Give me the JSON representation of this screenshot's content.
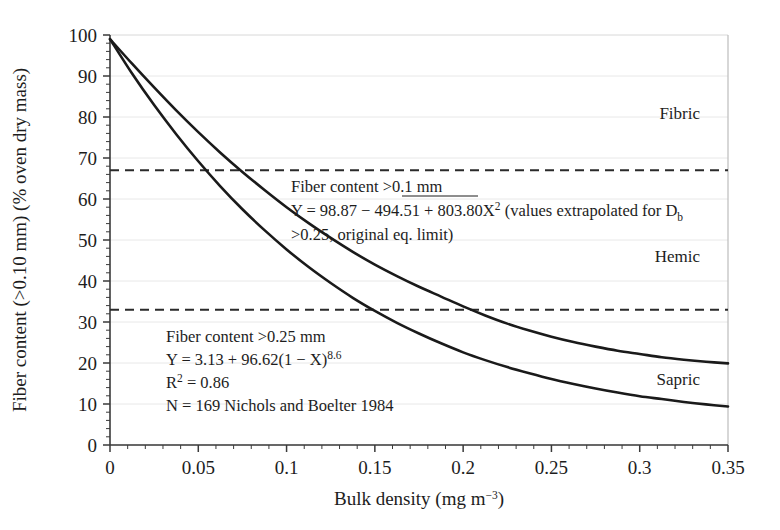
{
  "chart_data": {
    "type": "line",
    "title": "",
    "xlabel": "Bulk density (mg m−3)",
    "ylabel": "Fiber content (>0.10 mm) (% oven dry mass)",
    "xlim": [
      0,
      0.35
    ],
    "ylim": [
      0,
      100
    ],
    "xticks": [
      "0",
      "0.05",
      "0.1",
      "0.15",
      "0.2",
      "0.25",
      "0.3",
      "0.35"
    ],
    "xtick_values": [
      0,
      0.05,
      0.1,
      0.15,
      0.2,
      0.25,
      0.3,
      0.35
    ],
    "yticks": [
      "0",
      "10",
      "20",
      "30",
      "40",
      "50",
      "60",
      "70",
      "80",
      "90",
      "100"
    ],
    "ytick_values": [
      0,
      10,
      20,
      30,
      40,
      50,
      60,
      70,
      80,
      90,
      100
    ],
    "grid": true,
    "legend": "none",
    "x": [
      0,
      0.0125,
      0.025,
      0.0375,
      0.05,
      0.0625,
      0.075,
      0.0875,
      0.1,
      0.1125,
      0.125,
      0.1375,
      0.15,
      0.1625,
      0.175,
      0.1875,
      0.2,
      0.2125,
      0.225,
      0.2375,
      0.25,
      0.2625,
      0.275,
      0.2875,
      0.3,
      0.3125,
      0.325,
      0.3375,
      0.35
    ],
    "series": [
      {
        "name": "Fiber content >0.1 mm",
        "equation": "Y = 98.87 − 494.51 + 803.80X²",
        "values": [
          99.0,
          93.0,
          87.2,
          81.6,
          76.3,
          71.3,
          66.6,
          62.2,
          58.0,
          54.1,
          50.5,
          47.1,
          44.0,
          41.2,
          38.6,
          36.2,
          33.8,
          31.6,
          29.6,
          27.9,
          26.4,
          25.1,
          24.0,
          23.0,
          22.2,
          21.4,
          20.8,
          20.3,
          19.9
        ],
        "crosses_67_at_x": 0.075,
        "crosses_33_at_x": 0.195
      },
      {
        "name": "Fiber content >0.25 mm",
        "equation": "Y = 3.13 + 96.62(1 − X)^8.6",
        "r_squared": "0.86",
        "n": "169",
        "source": "Nichols and Boelter 1984",
        "values": [
          99.0,
          90.6,
          82.9,
          75.8,
          69.2,
          63.1,
          57.5,
          52.4,
          47.7,
          43.4,
          39.5,
          35.9,
          32.7,
          29.8,
          27.2,
          24.8,
          22.6,
          20.7,
          19.0,
          17.5,
          16.1,
          14.9,
          13.8,
          12.8,
          11.9,
          11.2,
          10.5,
          9.9,
          9.4
        ]
      }
    ],
    "reference_lines": [
      {
        "name": "fibric-hemic-boundary",
        "y": 67,
        "style": "dashed"
      },
      {
        "name": "hemic-sapric-boundary",
        "y": 33,
        "style": "dashed"
      }
    ],
    "zone_labels": [
      {
        "name": "Fibric",
        "y": 81
      },
      {
        "name": "Hemic",
        "y": 46
      },
      {
        "name": "Sapric",
        "y": 16
      }
    ],
    "annotations": {
      "upper": {
        "line1": "Fiber content >0.1 mm",
        "line2_a": "Y = 98.87 − 494.51 + 803.80X",
        "line2_sup": "2",
        "line2_b": " (values extrapolated for D",
        "line2_sub": "b",
        "line3": ">0.25, original eq. limit)"
      },
      "lower": {
        "line1": "Fiber content >0.25 mm",
        "line2_a": "Y = 3.13 + 96.62(1 − X)",
        "line2_sup": "8.6",
        "line3_a": "R",
        "line3_sup": "2",
        "line3_b": " = 0.86",
        "line4": "N = 169  Nichols and Boelter 1984"
      }
    },
    "colors": {
      "curve": "#1a1a1a",
      "grid": "#e8e8e8",
      "axis": "#3a3a3a",
      "dashed": "#2a2a2a",
      "background": "#ffffff"
    }
  }
}
